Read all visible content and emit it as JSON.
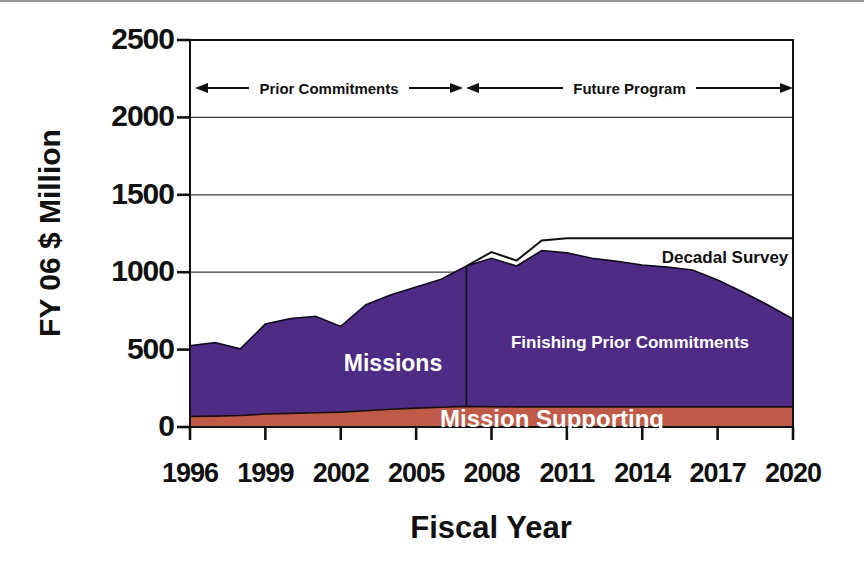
{
  "chart_data": {
    "type": "area",
    "stacked": true,
    "title": "",
    "xlabel": "Fiscal Year",
    "ylabel": "FY 06 $ Million",
    "x": [
      1996,
      1997,
      1998,
      1999,
      2000,
      2001,
      2002,
      2003,
      2004,
      2005,
      2006,
      2007,
      2008,
      2009,
      2010,
      2011,
      2012,
      2013,
      2014,
      2015,
      2016,
      2017,
      2018,
      2019,
      2020
    ],
    "x_tick_years": [
      1996,
      1999,
      2002,
      2005,
      2008,
      2011,
      2014,
      2017,
      2020
    ],
    "x_tick_labels": [
      "1996",
      "1999",
      "2002",
      "2005",
      "2008",
      "2011",
      "2014",
      "2017",
      "2020"
    ],
    "y_ticks": [
      0,
      500,
      1000,
      1500,
      2000,
      2500
    ],
    "y_tick_labels": [
      "0",
      "500",
      "1000",
      "1500",
      "2000",
      "2500"
    ],
    "ylim": [
      0,
      2500
    ],
    "xlim": [
      1996,
      2020
    ],
    "grid": "horizontal",
    "legend_position": "none",
    "note": "cumulative_top values are stacked totals in FY06 $ Million read from the plot; Decadal Survey band exists only from 2007 onward",
    "series": [
      {
        "name": "Mission Supporting",
        "color": "#c05a49",
        "outline": "#1a0f0c",
        "cumulative_top": [
          68,
          70,
          74,
          84,
          88,
          92,
          96,
          105,
          115,
          122,
          128,
          133,
          131,
          130,
          130,
          130,
          130,
          130,
          130,
          130,
          130,
          130,
          130,
          130,
          130
        ]
      },
      {
        "name": "Missions",
        "color": "#4e2c85",
        "outline": "#140b22",
        "cumulative_top": [
          525,
          545,
          505,
          665,
          700,
          715,
          650,
          790,
          855,
          905,
          955,
          1040,
          1090,
          1040,
          1140,
          1125,
          1090,
          1070,
          1047,
          1033,
          1014,
          950,
          872,
          788,
          698
        ]
      },
      {
        "name": "Decadal Survey",
        "color": "#ffffff",
        "outline": "#111111",
        "cumulative_top": [
          null,
          null,
          null,
          null,
          null,
          null,
          null,
          null,
          null,
          null,
          null,
          1040,
          1130,
          1075,
          1205,
          1220,
          1220,
          1220,
          1220,
          1220,
          1220,
          1220,
          1220,
          1220,
          1220
        ]
      }
    ],
    "divider_year": 2007,
    "area_labels": {
      "missions": "Missions",
      "finishing": "Finishing Prior Commitments",
      "supporting": "Mission Supporting",
      "decadal": "Decadal Survey"
    },
    "range_annotations": [
      {
        "text": "Prior Commitments",
        "from_year": 1996,
        "to_year": 2007
      },
      {
        "text": "Future Program",
        "from_year": 2007,
        "to_year": 2020
      }
    ]
  }
}
